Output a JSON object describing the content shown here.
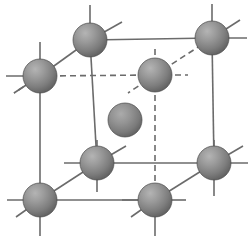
{
  "figure": {
    "name": "body-centered-cubic-unit-cell",
    "width": 251,
    "height": 244,
    "background_color": "#ffffff",
    "atom_count": 9,
    "corner_atom_count": 8,
    "center_atom_count": 1
  },
  "style": {
    "solid_line_color": "#6b6b6b",
    "dashed_line_color": "#6b6b6b",
    "solid_line_width": 1.6,
    "dashed_line_width": 1.6,
    "dash_pattern": "6,4",
    "sphere_light_color": "#a8a8a8",
    "sphere_mid_color": "#8b8b8b",
    "sphere_dark_color": "#5e5e5e",
    "sphere_edge_color": "#4a4a4a",
    "sphere_radius": 17,
    "center_sphere_radius": 17
  },
  "atoms": [
    {
      "id": "corner-back-top-left",
      "label": "back top left corner atom",
      "cx": 90,
      "cy": 40,
      "r": 17,
      "layer": "back"
    },
    {
      "id": "corner-back-top-right",
      "label": "back top right corner atom",
      "cx": 212,
      "cy": 38,
      "r": 17,
      "layer": "back"
    },
    {
      "id": "corner-front-top-left",
      "label": "front top left corner atom",
      "cx": 40,
      "cy": 76,
      "r": 17,
      "layer": "front"
    },
    {
      "id": "corner-back-bottom-mid",
      "label": "back top right inner atom",
      "cx": 155,
      "cy": 75,
      "r": 17,
      "layer": "back"
    },
    {
      "id": "atom-body-center",
      "label": "body center atom",
      "cx": 125,
      "cy": 120,
      "r": 17,
      "layer": "center"
    },
    {
      "id": "corner-front-mid-left",
      "label": "front bottom left upper atom",
      "cx": 97,
      "cy": 163,
      "r": 17,
      "layer": "front"
    },
    {
      "id": "corner-front-mid-right",
      "label": "front bottom right atom",
      "cx": 214,
      "cy": 163,
      "r": 17,
      "layer": "front"
    },
    {
      "id": "corner-front-bottom-left",
      "label": "front bottom left atom",
      "cx": 40,
      "cy": 200,
      "r": 17,
      "layer": "front"
    },
    {
      "id": "corner-front-bottom-mid",
      "label": "front bottom middle atom",
      "cx": 155,
      "cy": 200,
      "r": 17,
      "layer": "front"
    }
  ],
  "bonds_solid": [
    {
      "id": "edge-top-back",
      "label": "top back horizontal edge",
      "x1": 90,
      "y1": 40,
      "x2": 212,
      "y2": 38
    },
    {
      "id": "edge-top-left-diagonal",
      "label": "top left diagonal edge",
      "x1": 40,
      "y1": 76,
      "x2": 90,
      "y2": 40
    },
    {
      "id": "edge-left-vertical",
      "label": "left front vertical edge",
      "x1": 40,
      "y1": 76,
      "x2": 40,
      "y2": 200
    },
    {
      "id": "edge-back-left-vertical",
      "label": "back left vertical edge",
      "x1": 90,
      "y1": 40,
      "x2": 97,
      "y2": 163
    },
    {
      "id": "edge-right-vertical",
      "label": "right back vertical edge",
      "x1": 212,
      "y1": 38,
      "x2": 214,
      "y2": 163
    },
    {
      "id": "edge-bottom-front",
      "label": "bottom front horizontal edge",
      "x1": 40,
      "y1": 200,
      "x2": 155,
      "y2": 200
    },
    {
      "id": "edge-mid-horizontal",
      "label": "middle horizontal edge",
      "x1": 97,
      "y1": 163,
      "x2": 214,
      "y2": 163
    },
    {
      "id": "edge-bottom-diagonal",
      "label": "bottom left diagonal edge",
      "x1": 40,
      "y1": 200,
      "x2": 97,
      "y2": 163
    },
    {
      "id": "edge-bottom-right-diag",
      "label": "bottom right diagonal edge",
      "x1": 155,
      "y1": 200,
      "x2": 214,
      "y2": 163
    }
  ],
  "bonds_dashed": [
    {
      "id": "hidden-edge-horizontal",
      "label": "hidden back horizontal edge",
      "x1": 40,
      "y1": 76,
      "x2": 155,
      "y2": 75
    },
    {
      "id": "hidden-edge-diagonal",
      "label": "hidden back diagonal edge",
      "x1": 155,
      "y1": 75,
      "x2": 212,
      "y2": 38
    },
    {
      "id": "hidden-edge-vertical",
      "label": "hidden back vertical edge",
      "x1": 155,
      "y1": 75,
      "x2": 155,
      "y2": 200
    }
  ],
  "stubs_solid": [
    {
      "id": "stub-tl-up",
      "label": "top left upward stub",
      "x1": 90,
      "y1": 40,
      "x2": 90,
      "y2": 5
    },
    {
      "id": "stub-tl-right",
      "label": "top left right stub",
      "x1": 90,
      "y1": 40,
      "x2": 122,
      "y2": 22
    },
    {
      "id": "stub-tr-up",
      "label": "top right upward stub",
      "x1": 212,
      "y1": 38,
      "x2": 212,
      "y2": 4
    },
    {
      "id": "stub-tr-right",
      "label": "top right rightward stub",
      "x1": 212,
      "y1": 38,
      "x2": 247,
      "y2": 38
    },
    {
      "id": "stub-tr-diag",
      "label": "top right diagonal stub",
      "x1": 212,
      "y1": 38,
      "x2": 240,
      "y2": 20
    },
    {
      "id": "stub-ftl-up",
      "label": "front top left upward stub",
      "x1": 40,
      "y1": 76,
      "x2": 40,
      "y2": 42
    },
    {
      "id": "stub-ftl-left",
      "label": "front top left left stub",
      "x1": 40,
      "y1": 76,
      "x2": 6,
      "y2": 76
    },
    {
      "id": "stub-ftl-diag",
      "label": "front top left diagonal stub",
      "x1": 40,
      "y1": 76,
      "x2": 14,
      "y2": 93
    },
    {
      "id": "stub-fml-up",
      "label": "front mid left upward stub",
      "x1": 97,
      "y1": 163,
      "x2": 97,
      "y2": 140
    },
    {
      "id": "stub-fml-left",
      "label": "front mid left left stub",
      "x1": 97,
      "y1": 163,
      "x2": 64,
      "y2": 163
    },
    {
      "id": "stub-fml-diag",
      "label": "front mid left diagonal stub",
      "x1": 97,
      "y1": 163,
      "x2": 126,
      "y2": 146
    },
    {
      "id": "stub-fml-down",
      "label": "front mid left downward stub",
      "x1": 97,
      "y1": 163,
      "x2": 97,
      "y2": 192
    },
    {
      "id": "stub-fmr-up",
      "label": "front mid right upward stub",
      "x1": 214,
      "y1": 163,
      "x2": 214,
      "y2": 140
    },
    {
      "id": "stub-fmr-right",
      "label": "front mid right right stub",
      "x1": 214,
      "y1": 163,
      "x2": 248,
      "y2": 163
    },
    {
      "id": "stub-fmr-diag",
      "label": "front mid right diagonal stub",
      "x1": 214,
      "y1": 163,
      "x2": 243,
      "y2": 146
    },
    {
      "id": "stub-fmr-down",
      "label": "front mid right down stub",
      "x1": 214,
      "y1": 163,
      "x2": 214,
      "y2": 196
    },
    {
      "id": "stub-fbl-left",
      "label": "bottom left left stub",
      "x1": 40,
      "y1": 200,
      "x2": 7,
      "y2": 200
    },
    {
      "id": "stub-fbl-diag",
      "label": "bottom left diagonal stub",
      "x1": 40,
      "y1": 200,
      "x2": 16,
      "y2": 217
    },
    {
      "id": "stub-fbl-down",
      "label": "bottom left downward stub",
      "x1": 40,
      "y1": 200,
      "x2": 40,
      "y2": 236
    },
    {
      "id": "stub-fbm-left",
      "label": "bottom middle left stub",
      "x1": 155,
      "y1": 200,
      "x2": 122,
      "y2": 200
    },
    {
      "id": "stub-fbm-diag",
      "label": "bottom middle diagonal stub",
      "x1": 155,
      "y1": 200,
      "x2": 131,
      "y2": 217
    },
    {
      "id": "stub-fbm-down",
      "label": "bottom middle downward stub",
      "x1": 155,
      "y1": 200,
      "x2": 155,
      "y2": 236
    },
    {
      "id": "stub-fbm-right",
      "label": "bottom middle right stub",
      "x1": 155,
      "y1": 200,
      "x2": 186,
      "y2": 200
    }
  ],
  "stubs_dashed": [
    {
      "id": "stub-bc-up",
      "label": "back center upward stub",
      "x1": 155,
      "y1": 75,
      "x2": 155,
      "y2": 46
    },
    {
      "id": "stub-bc-right",
      "label": "back center right stub",
      "x1": 155,
      "y1": 75,
      "x2": 188,
      "y2": 75
    },
    {
      "id": "stub-bc-diag",
      "label": "back center diagonal stub",
      "x1": 155,
      "y1": 75,
      "x2": 128,
      "y2": 93
    },
    {
      "id": "stub-ftl-dash",
      "label": "front top left dashed stub",
      "x1": 40,
      "y1": 76,
      "x2": 14,
      "y2": 93
    }
  ]
}
